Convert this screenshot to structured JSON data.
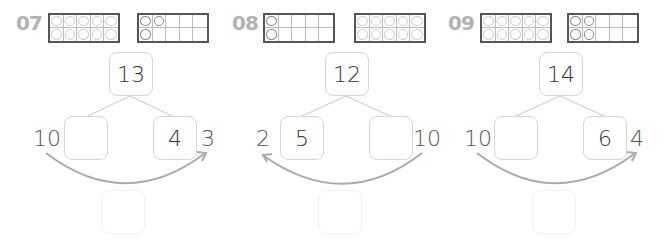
{
  "exercises": [
    {
      "number": "07",
      "frame_left": {
        "filled": 10,
        "style": "light"
      },
      "frame_right": {
        "filled": 3,
        "style": "dark",
        "pattern": [
          1,
          1,
          0,
          0,
          0,
          1,
          0,
          0,
          0,
          0
        ]
      },
      "total": "13",
      "left_box": "",
      "right_box": "4",
      "left_label": "10",
      "right_label": "3",
      "arrow_direction": "left-to-right",
      "answer_box": ""
    },
    {
      "number": "08",
      "frame_left": {
        "filled": 2,
        "style": "dark",
        "pattern": [
          1,
          0,
          0,
          0,
          0,
          1,
          0,
          0,
          0,
          0
        ]
      },
      "frame_right": {
        "filled": 10,
        "style": "light"
      },
      "total": "12",
      "left_box": "5",
      "right_box": "",
      "left_label": "2",
      "right_label": "10",
      "arrow_direction": "right-to-left",
      "answer_box": ""
    },
    {
      "number": "09",
      "frame_left": {
        "filled": 10,
        "style": "light"
      },
      "frame_right": {
        "filled": 4,
        "style": "dark",
        "pattern": [
          1,
          1,
          0,
          0,
          0,
          1,
          1,
          0,
          0,
          0
        ]
      },
      "total": "14",
      "left_box": "",
      "right_box": "6",
      "left_label": "10",
      "right_label": "4",
      "arrow_direction": "left-to-right",
      "answer_box": ""
    }
  ],
  "colors": {
    "number_label": "#b3b3b3",
    "frame_border": "#555555",
    "box_border": "#d6d6d6",
    "connector": "#c8c8c8",
    "arrow": "#aaaaaa"
  }
}
